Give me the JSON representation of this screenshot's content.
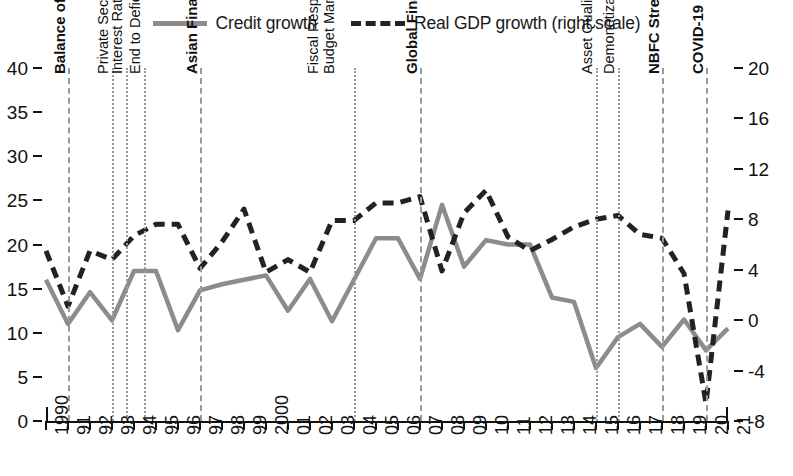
{
  "legend": {
    "items": [
      {
        "label": "Credit growth",
        "style": "solid",
        "color": "#8c8c8c",
        "icon": "solid-line-swatch"
      },
      {
        "label": "Real GDP growth (right scale)",
        "style": "dashed",
        "color": "#222222",
        "icon": "dashed-line-swatch"
      }
    ]
  },
  "axes": {
    "left": {
      "ticks": [
        0,
        5,
        10,
        15,
        20,
        25,
        30,
        35,
        40
      ],
      "min": 0,
      "max": 40
    },
    "right": {
      "ticks": [
        -8,
        -4,
        0,
        4,
        8,
        12,
        16,
        20
      ],
      "min": -8,
      "max": 20
    },
    "x": {
      "labels": [
        "1990",
        "91",
        "92",
        "93",
        "94",
        "95",
        "96",
        "97",
        "98",
        "99",
        "2000",
        "01",
        "02",
        "03",
        "04",
        "05",
        "06",
        "07",
        "08",
        "09",
        "10",
        "11",
        "12",
        "13",
        "14",
        "15",
        "16",
        "17",
        "18",
        "19",
        "20",
        "21"
      ]
    }
  },
  "events": [
    {
      "label": "Balance of Payments Crisis",
      "year": "91",
      "style": "dashed",
      "bold": true,
      "lines": 1
    },
    {
      "label": "Private Sector Entry",
      "year": "93",
      "style": "dotted",
      "bold": false,
      "lines": 1
    },
    {
      "label": "Interest Rate Deregulation",
      "year": "94",
      "style": "dotted",
      "bold": false,
      "lines": 1
    },
    {
      "label": "End to Deficit Monetization",
      "year": "94",
      "style": "dotted",
      "bold": false,
      "lines": 1
    },
    {
      "label": "Asian Financial Crisis",
      "year": "97",
      "style": "dashed",
      "bold": true,
      "lines": 1
    },
    {
      "label": "Fiscal Responsibility and Budget Management Act",
      "year": "04",
      "style": "dotted",
      "bold": false,
      "lines": 3
    },
    {
      "label": "Global Financial Crisis",
      "year": "07",
      "style": "dashed",
      "bold": true,
      "lines": 1
    },
    {
      "label": "Asset Quality Review",
      "year": "15",
      "style": "dotted",
      "bold": false,
      "lines": 1
    },
    {
      "label": "Demonetization, IBC, FIT",
      "year": "16",
      "style": "dotted",
      "bold": false,
      "lines": 1
    },
    {
      "label": "NBFC Stress",
      "year": "18",
      "style": "dashed",
      "bold": true,
      "lines": 1
    },
    {
      "label": "COVID-19",
      "year": "20",
      "style": "dashed",
      "bold": true,
      "lines": 1
    }
  ],
  "chart_data": {
    "type": "line",
    "title": "",
    "xlabel": "",
    "ylabel": "",
    "ylim": [
      0,
      40
    ],
    "y2lim": [
      -8,
      20
    ],
    "grid": false,
    "legend_position": "top-center",
    "x": [
      "1990",
      "91",
      "92",
      "93",
      "94",
      "95",
      "96",
      "97",
      "98",
      "99",
      "2000",
      "01",
      "02",
      "03",
      "04",
      "05",
      "06",
      "07",
      "08",
      "09",
      "10",
      "11",
      "12",
      "13",
      "14",
      "15",
      "16",
      "17",
      "18",
      "19",
      "20",
      "21"
    ],
    "series": [
      {
        "name": "Credit growth",
        "axis": "left",
        "style": "solid",
        "color": "#8c8c8c",
        "values": [
          16.0,
          11.0,
          14.6,
          11.4,
          17.0,
          17.0,
          10.3,
          14.8,
          15.5,
          16.0,
          16.5,
          12.5,
          16.1,
          11.3,
          16.0,
          20.7,
          20.7,
          16.1,
          24.5,
          17.5,
          20.5,
          20.0,
          20.0,
          14.0,
          13.5,
          6.0,
          9.5,
          11.0,
          8.4,
          11.5,
          8.0,
          10.5
        ]
      },
      {
        "name": "Real GDP growth (right scale)",
        "axis": "right",
        "style": "dashed",
        "color": "#222222",
        "values": [
          5.5,
          1.1,
          5.5,
          4.8,
          6.7,
          7.6,
          7.6,
          4.1,
          6.2,
          8.8,
          3.8,
          4.8,
          3.8,
          7.9,
          7.9,
          9.3,
          9.3,
          9.8,
          3.9,
          8.5,
          10.3,
          6.6,
          5.5,
          6.4,
          7.4,
          8.0,
          8.3,
          6.8,
          6.5,
          3.7,
          -6.6,
          8.7
        ]
      }
    ]
  }
}
